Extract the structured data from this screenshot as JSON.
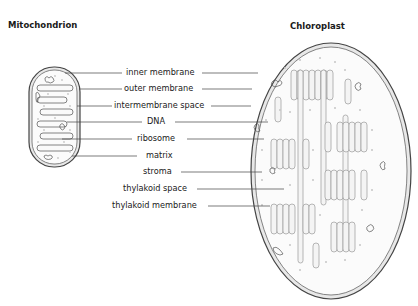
{
  "titles": {
    "left": "Mitochondrion",
    "right": "Chloroplast"
  },
  "labels": {
    "inner_membrane": "inner membrane",
    "outer_membrane": "outer membrane",
    "intermembrane_space": "intermembrane space",
    "dna": "DNA",
    "ribosome": "ribosome",
    "matrix": "matrix",
    "stroma": "stroma",
    "thylakoid_space": "thylakoid space",
    "thylakoid_membrane": "thylakoid membrane"
  },
  "colors": {
    "outline": "#555555",
    "fill": "#f2f2f2",
    "text": "#1a1a1a",
    "dots": "#b5b5b5"
  }
}
